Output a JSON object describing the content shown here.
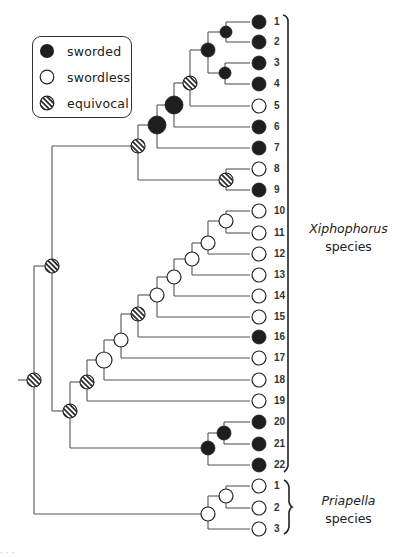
{
  "legend": {
    "items": [
      {
        "state": "sworded",
        "label": "sworded"
      },
      {
        "state": "swordless",
        "label": "swordless"
      },
      {
        "state": "equivocal",
        "label": "equivocal"
      }
    ]
  },
  "colors": {
    "line": "#555555",
    "sworded_fill": "#1e1e1e",
    "swordless_fill": "#ffffff",
    "outline": "#222222",
    "hatch": "#222222"
  },
  "groups": [
    {
      "genus": "Xiphophorus",
      "suffix": "species",
      "tips_from": 1,
      "tips_to": 22
    },
    {
      "genus": "Priapella",
      "suffix": "species",
      "tips_from": 1,
      "tips_to": 3
    }
  ],
  "tips": [
    {
      "id": "X1",
      "label": "1",
      "state": "sworded",
      "y": 22
    },
    {
      "id": "X2",
      "label": "2",
      "state": "sworded",
      "y": 42
    },
    {
      "id": "X3",
      "label": "3",
      "state": "sworded",
      "y": 63
    },
    {
      "id": "X4",
      "label": "4",
      "state": "sworded",
      "y": 84
    },
    {
      "id": "X5",
      "label": "5",
      "state": "swordless",
      "y": 106
    },
    {
      "id": "X6",
      "label": "6",
      "state": "sworded",
      "y": 127
    },
    {
      "id": "X7",
      "label": "7",
      "state": "sworded",
      "y": 148
    },
    {
      "id": "X8",
      "label": "8",
      "state": "swordless",
      "y": 169
    },
    {
      "id": "X9",
      "label": "9",
      "state": "sworded",
      "y": 190
    },
    {
      "id": "X10",
      "label": "10",
      "state": "swordless",
      "y": 211
    },
    {
      "id": "X11",
      "label": "11",
      "state": "swordless",
      "y": 233
    },
    {
      "id": "X12",
      "label": "12",
      "state": "swordless",
      "y": 254
    },
    {
      "id": "X13",
      "label": "13",
      "state": "swordless",
      "y": 275
    },
    {
      "id": "X14",
      "label": "14",
      "state": "swordless",
      "y": 296
    },
    {
      "id": "X15",
      "label": "15",
      "state": "swordless",
      "y": 317
    },
    {
      "id": "X16",
      "label": "16",
      "state": "sworded",
      "y": 337
    },
    {
      "id": "X17",
      "label": "17",
      "state": "swordless",
      "y": 358
    },
    {
      "id": "X18",
      "label": "18",
      "state": "swordless",
      "y": 380
    },
    {
      "id": "X19",
      "label": "19",
      "state": "swordless",
      "y": 401
    },
    {
      "id": "X20",
      "label": "20",
      "state": "sworded",
      "y": 422
    },
    {
      "id": "X21",
      "label": "21",
      "state": "sworded",
      "y": 444
    },
    {
      "id": "X22",
      "label": "22",
      "state": "sworded",
      "y": 465
    },
    {
      "id": "P1",
      "label": "1",
      "state": "swordless",
      "y": 486
    },
    {
      "id": "P2",
      "label": "2",
      "state": "swordless",
      "y": 508
    },
    {
      "id": "P3",
      "label": "3",
      "state": "swordless",
      "y": 529
    }
  ],
  "nodes": [
    {
      "id": "root",
      "x": 34,
      "y": 380,
      "r": 7,
      "state": "equivocal",
      "children": [
        "xipho",
        "pria"
      ],
      "stub": 16
    },
    {
      "id": "xipho",
      "x": 52,
      "y": 266,
      "r": 7,
      "state": "equivocal",
      "children": [
        "n1_9",
        "n10_22"
      ]
    },
    {
      "id": "n1_9",
      "x": 138,
      "y": 146,
      "r": 7,
      "state": "equivocal",
      "children": [
        "n1_7",
        "n8_9"
      ]
    },
    {
      "id": "n1_7",
      "x": 157,
      "y": 125,
      "r": 9,
      "state": "sworded",
      "children": [
        "n1_6",
        "X7"
      ]
    },
    {
      "id": "n1_6",
      "x": 174,
      "y": 105,
      "r": 9,
      "state": "sworded",
      "children": [
        "n1_5",
        "X6"
      ]
    },
    {
      "id": "n1_5",
      "x": 190,
      "y": 83,
      "r": 7,
      "state": "equivocal",
      "children": [
        "n1_4",
        "X5"
      ]
    },
    {
      "id": "n1_4",
      "x": 208,
      "y": 50,
      "r": 7,
      "state": "sworded",
      "children": [
        "n1_2",
        "n3_4"
      ]
    },
    {
      "id": "n1_2",
      "x": 226,
      "y": 32,
      "r": 6,
      "state": "sworded",
      "children": [
        "X1",
        "X2"
      ]
    },
    {
      "id": "n3_4",
      "x": 225,
      "y": 73,
      "r": 6,
      "state": "sworded",
      "children": [
        "X3",
        "X4"
      ]
    },
    {
      "id": "n8_9",
      "x": 226,
      "y": 180,
      "r": 7,
      "state": "equivocal",
      "children": [
        "X8",
        "X9"
      ]
    },
    {
      "id": "n10_22",
      "x": 70,
      "y": 411,
      "r": 7,
      "state": "equivocal",
      "children": [
        "n10_19",
        "n20_22"
      ]
    },
    {
      "id": "n10_19",
      "x": 87,
      "y": 382,
      "r": 7,
      "state": "equivocal",
      "children": [
        "n10_18",
        "X19"
      ]
    },
    {
      "id": "n10_18",
      "x": 104,
      "y": 360,
      "r": 8,
      "state": "swordless",
      "children": [
        "n10_17",
        "X18"
      ]
    },
    {
      "id": "n10_17",
      "x": 121,
      "y": 340,
      "r": 7,
      "state": "swordless",
      "children": [
        "n10_16",
        "X17"
      ]
    },
    {
      "id": "n10_16",
      "x": 138,
      "y": 314,
      "r": 7,
      "state": "equivocal",
      "children": [
        "n10_15",
        "X16"
      ]
    },
    {
      "id": "n10_15",
      "x": 157,
      "y": 295,
      "r": 7,
      "state": "swordless",
      "children": [
        "n10_14",
        "X15"
      ]
    },
    {
      "id": "n10_14",
      "x": 174,
      "y": 277,
      "r": 7,
      "state": "swordless",
      "children": [
        "n10_13",
        "X14"
      ]
    },
    {
      "id": "n10_13",
      "x": 192,
      "y": 259,
      "r": 7,
      "state": "swordless",
      "children": [
        "n10_12",
        "X13"
      ]
    },
    {
      "id": "n10_12",
      "x": 208,
      "y": 243,
      "r": 7,
      "state": "swordless",
      "children": [
        "n10_11",
        "X12"
      ]
    },
    {
      "id": "n10_11",
      "x": 226,
      "y": 221,
      "r": 7,
      "state": "swordless",
      "children": [
        "X10",
        "X11"
      ]
    },
    {
      "id": "n20_22",
      "x": 208,
      "y": 448,
      "r": 7,
      "state": "sworded",
      "children": [
        "n20_21",
        "X22"
      ]
    },
    {
      "id": "n20_21",
      "x": 224,
      "y": 433,
      "r": 7,
      "state": "sworded",
      "children": [
        "X20",
        "X21"
      ]
    },
    {
      "id": "pria",
      "x": 208,
      "y": 514,
      "r": 7,
      "state": "swordless",
      "children": [
        "p1_2",
        "P3"
      ]
    },
    {
      "id": "p1_2",
      "x": 226,
      "y": 496,
      "r": 7,
      "state": "swordless",
      "children": [
        "P1",
        "P2"
      ]
    }
  ],
  "layout": {
    "tip_circle_x": 259,
    "tip_circle_r": 7,
    "tip_line_end_x": 250,
    "tip_label_x": 274
  },
  "caption_fragment": "· · ·"
}
